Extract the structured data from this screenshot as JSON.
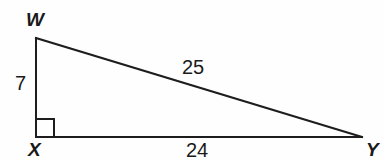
{
  "figure": {
    "type": "right-triangle",
    "background_color": "#fefefe",
    "stroke_color": "#1d1d1d",
    "text_color": "#1a1a1a",
    "vertices": [
      {
        "id": "W",
        "label": "W",
        "x": 36,
        "y": 38,
        "label_x": 26,
        "label_y": 26
      },
      {
        "id": "X",
        "label": "X",
        "x": 36,
        "y": 137,
        "label_x": 28,
        "label_y": 156
      },
      {
        "id": "Y",
        "label": "Y",
        "x": 362,
        "y": 137,
        "label_x": 366,
        "label_y": 156
      }
    ],
    "edges": [
      {
        "id": "WX",
        "from": "W",
        "to": "X",
        "measure": "7",
        "label_x": 15,
        "label_y": 90
      },
      {
        "id": "XY",
        "from": "X",
        "to": "Y",
        "measure": "24",
        "label_x": 186,
        "label_y": 157
      },
      {
        "id": "WY",
        "from": "W",
        "to": "Y",
        "measure": "25",
        "label_x": 182,
        "label_y": 74
      }
    ],
    "right_angle": {
      "at_vertex": "X",
      "size": 18,
      "marker_name": "right-angle-square"
    }
  }
}
